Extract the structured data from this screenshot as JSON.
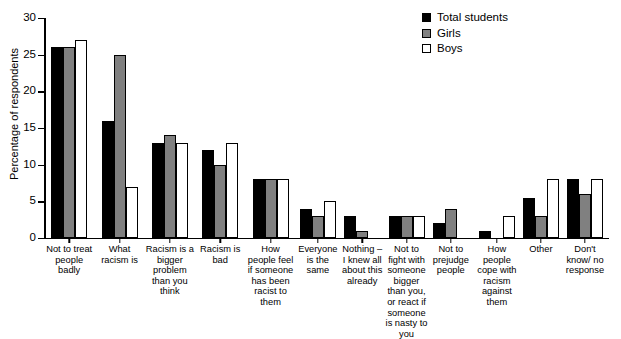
{
  "chart_data": {
    "type": "bar",
    "title": "",
    "xlabel": "",
    "ylabel": "Percentage of respondents",
    "ylim": [
      0,
      30
    ],
    "yticks": [
      0,
      5,
      10,
      15,
      20,
      25,
      30
    ],
    "grid": false,
    "legend_position": "top-right",
    "categories": [
      "Not to treat people badly",
      "What racism is",
      "Racism is a bigger problem than you think",
      "Racism is bad",
      "How people feel if someone has been racist to them",
      "Everyone is the same",
      "Nothing – I knew all about this already",
      "Not to fight with someone bigger than you, or react if someone is nasty to you",
      "Not to prejudge people",
      "How people cope with racism against them",
      "Other",
      "Don't know/ no response"
    ],
    "series": [
      {
        "name": "Total students",
        "color": "#000000",
        "values": [
          26,
          16,
          13,
          12,
          8,
          4,
          3,
          3,
          2,
          1,
          5.5,
          8
        ]
      },
      {
        "name": "Girls",
        "color": "#808080",
        "values": [
          26,
          25,
          14,
          10,
          8,
          3,
          1,
          3,
          4,
          0,
          3,
          6
        ]
      },
      {
        "name": "Boys",
        "color": "#ffffff",
        "values": [
          27,
          7,
          13,
          13,
          8,
          5,
          0,
          3,
          0,
          3,
          8,
          8
        ]
      }
    ]
  }
}
